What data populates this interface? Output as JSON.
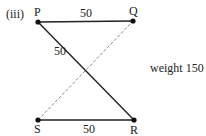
{
  "figure": {
    "part_label": "(iii)",
    "nodes": [
      {
        "id": "P",
        "label": "P",
        "x": 38,
        "y": 22
      },
      {
        "id": "Q",
        "label": "Q",
        "x": 133,
        "y": 21
      },
      {
        "id": "S",
        "label": "S",
        "x": 38,
        "y": 120
      },
      {
        "id": "R",
        "label": "R",
        "x": 134,
        "y": 120
      }
    ],
    "edges": [
      {
        "from": "P",
        "to": "Q",
        "weight": "50",
        "style": "solid"
      },
      {
        "from": "P",
        "to": "R",
        "weight": "50",
        "style": "solid"
      },
      {
        "from": "S",
        "to": "R",
        "weight": "50",
        "style": "solid"
      },
      {
        "from": "S",
        "to": "Q",
        "weight": "",
        "style": "dashed"
      }
    ],
    "total_label": "weight 150",
    "colors": {
      "edge": "#222222",
      "dashed_edge": "#888888",
      "node": "#111111"
    }
  }
}
